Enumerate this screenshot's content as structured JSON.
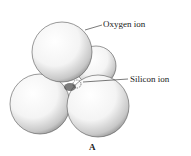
{
  "diagram": {
    "labels": {
      "oxygen": "Oxygen ion",
      "silicon": "Silicon ion"
    },
    "caption": "A",
    "spheres": [
      {
        "name": "back-oxygen",
        "cx": 96,
        "cy": 66,
        "r": 20
      },
      {
        "name": "bottom-left-oxygen",
        "cx": 40,
        "cy": 104,
        "r": 30
      },
      {
        "name": "bottom-right-oxygen",
        "cx": 98,
        "cy": 106,
        "r": 31
      },
      {
        "name": "top-oxygen",
        "cx": 62,
        "cy": 52,
        "r": 30
      }
    ],
    "colors": {
      "ink": "#222222",
      "shade": "#9a9a9a"
    }
  }
}
